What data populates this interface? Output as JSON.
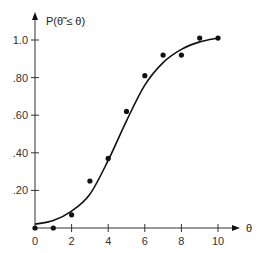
{
  "chart_data": {
    "type": "scatter",
    "title": "",
    "xlabel": "θ",
    "ylabel": "P(θ̃ ≤ θ)",
    "xlim": [
      0,
      10
    ],
    "ylim": [
      0,
      1.0
    ],
    "grid": false,
    "legend": null,
    "x_ticks": [
      "0",
      "2",
      "4",
      "6",
      "8",
      "10"
    ],
    "y_ticks": [
      ".20",
      ".40",
      ".60",
      ".80",
      "1.0"
    ],
    "series": [
      {
        "name": "observed",
        "kind": "points",
        "x": [
          0,
          1,
          2,
          3,
          4,
          5,
          6,
          7,
          8,
          9,
          10
        ],
        "y": [
          0.0,
          0.0,
          0.07,
          0.25,
          0.37,
          0.62,
          0.81,
          0.92,
          0.92,
          1.01,
          1.01
        ]
      },
      {
        "name": "fitted curve",
        "kind": "smooth-line",
        "x": [
          0,
          1,
          2,
          3,
          4,
          5,
          6,
          7,
          8,
          9,
          10
        ],
        "y": [
          0.02,
          0.04,
          0.09,
          0.18,
          0.36,
          0.57,
          0.76,
          0.88,
          0.95,
          0.99,
          1.01
        ]
      }
    ]
  },
  "axes": {
    "x_title": "θ",
    "y_title": "P(θ̃ ≤ θ)"
  },
  "colors": {
    "ink": "#111111",
    "axis": "#333333"
  }
}
